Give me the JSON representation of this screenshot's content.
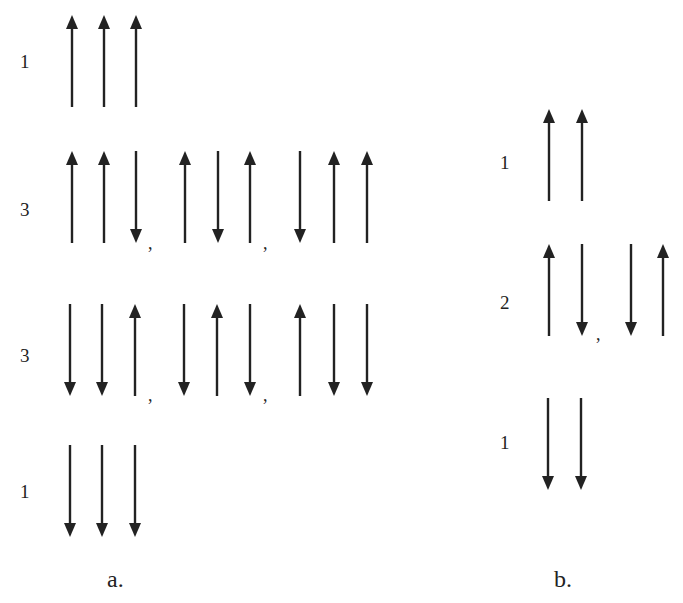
{
  "panel_a": {
    "caption": "a.",
    "rows": [
      {
        "multiplicity": "1",
        "configurations": [
          [
            "up",
            "up",
            "up"
          ]
        ]
      },
      {
        "multiplicity": "3",
        "configurations": [
          [
            "up",
            "up",
            "down"
          ],
          [
            "up",
            "down",
            "up"
          ],
          [
            "down",
            "up",
            "up"
          ]
        ]
      },
      {
        "multiplicity": "3",
        "configurations": [
          [
            "down",
            "down",
            "up"
          ],
          [
            "down",
            "up",
            "down"
          ],
          [
            "up",
            "down",
            "down"
          ]
        ]
      },
      {
        "multiplicity": "1",
        "configurations": [
          [
            "down",
            "down",
            "down"
          ]
        ]
      }
    ]
  },
  "panel_b": {
    "caption": "b.",
    "rows": [
      {
        "multiplicity": "1",
        "configurations": [
          [
            "up",
            "up"
          ]
        ]
      },
      {
        "multiplicity": "2",
        "configurations": [
          [
            "up",
            "down"
          ],
          [
            "down",
            "up"
          ]
        ]
      },
      {
        "multiplicity": "1",
        "configurations": [
          [
            "down",
            "down"
          ]
        ]
      }
    ]
  },
  "separator": ",",
  "colors": {
    "arrow": "#222222",
    "background": "#ffffff"
  }
}
